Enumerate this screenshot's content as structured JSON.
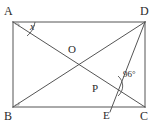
{
  "figure": {
    "kind": "geometry-diagram",
    "shape": "rectangle-with-diagonals",
    "stroke_color": "#555555",
    "label_color": "#2b2b2b",
    "background_color": "#ffffff",
    "width": 156,
    "height": 127
  },
  "vertices": {
    "A": {
      "label": "A",
      "x": 13,
      "y": 22
    },
    "B": {
      "label": "B",
      "x": 13,
      "y": 107
    },
    "C": {
      "label": "C",
      "x": 145,
      "y": 107
    },
    "D": {
      "label": "D",
      "x": 145,
      "y": 22
    }
  },
  "points": {
    "O": {
      "label": "O",
      "x": 79,
      "y": 64.5,
      "description": "intersection-of-diagonals"
    },
    "P": {
      "label": "P",
      "x": 108,
      "y": 88,
      "description": "intersection-of-AC-and-DE"
    },
    "E": {
      "label": "E",
      "x": 111,
      "y": 107,
      "description": "point-on-segment-BC"
    }
  },
  "segments": [
    {
      "name": "side-AD",
      "from": "A",
      "to": "D"
    },
    {
      "name": "side-DC",
      "from": "D",
      "to": "C"
    },
    {
      "name": "side-CB",
      "from": "C",
      "to": "B"
    },
    {
      "name": "side-BA",
      "from": "B",
      "to": "A"
    },
    {
      "name": "diagonal-AC",
      "from": "A",
      "to": "C"
    },
    {
      "name": "diagonal-BD",
      "from": "B",
      "to": "D"
    },
    {
      "name": "cevian-DE",
      "from": "D",
      "to": "E"
    }
  ],
  "angles": {
    "x": {
      "label": "x",
      "vertex": "A",
      "between": [
        "AD",
        "AC"
      ],
      "value": "x"
    },
    "ninety_six": {
      "label": "96°",
      "vertex": "P",
      "between": [
        "PC",
        "PD"
      ],
      "value": "96°"
    }
  }
}
